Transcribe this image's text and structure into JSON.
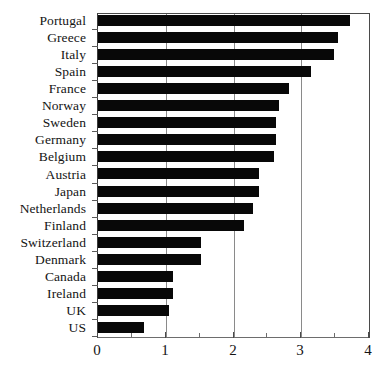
{
  "chart_data": {
    "type": "bar",
    "orientation": "horizontal",
    "title": "",
    "xlabel": "",
    "ylabel": "",
    "xlim": [
      0,
      4
    ],
    "grid": "vertical gridlines at 1, 2, 3",
    "legend": "none",
    "bar_color": "#080808",
    "x_ticks_major": [
      "0",
      "1",
      "2",
      "3",
      "4"
    ],
    "x_ticks_minor": [
      0.5,
      1.5,
      2.5,
      3.5
    ],
    "categories": [
      "Portugal",
      "Greece",
      "Italy",
      "Spain",
      "France",
      "Norway",
      "Sweden",
      "Germany",
      "Belgium",
      "Austria",
      "Japan",
      "Netherlands",
      "Finland",
      "Switzerland",
      "Denmark",
      "Canada",
      "Ireland",
      "UK",
      "US"
    ],
    "values": [
      3.72,
      3.54,
      3.48,
      3.14,
      2.82,
      2.67,
      2.63,
      2.63,
      2.6,
      2.37,
      2.37,
      2.29,
      2.15,
      1.52,
      1.52,
      1.11,
      1.1,
      1.05,
      0.68
    ]
  }
}
